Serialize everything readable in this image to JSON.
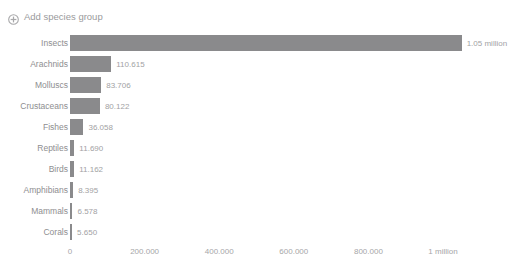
{
  "page": {
    "background_color": "#ffffff",
    "ghost_header_text": "· · ·   · ·   · ·   ·   · · ·   ·   ·"
  },
  "toolbar": {
    "add_group_label": "Add species group",
    "add_group_icon": "circle-plus-icon",
    "text_color": "#9a9a9c"
  },
  "chart_data": {
    "type": "bar",
    "orientation": "horizontal",
    "title": "",
    "subtitle": "",
    "xlabel": "",
    "ylabel": "",
    "grid": false,
    "legend": false,
    "bar_color": "#8a8a8c",
    "value_label_color": "#a2a2a4",
    "category_label_color": "#8e8e90",
    "xlim": [
      0,
      1100000
    ],
    "xticks": [
      0,
      200000,
      400000,
      600000,
      800000,
      1000000
    ],
    "xticklabels": [
      "0",
      "200.000",
      "400.000",
      "600.000",
      "800.000",
      "1 million"
    ],
    "categories": [
      "Insects",
      "Arachnids",
      "Molluscs",
      "Crustaceans",
      "Fishes",
      "Reptiles",
      "Birds",
      "Amphibians",
      "Mammals",
      "Corals"
    ],
    "values": [
      1050000,
      110615,
      83706,
      80122,
      36058,
      11690,
      11162,
      8395,
      6578,
      5650
    ],
    "value_labels": [
      "1.05 million",
      "110.615",
      "83.706",
      "80.122",
      "36.058",
      "11.690",
      "11.162",
      "8.395",
      "6.578",
      "5.650"
    ]
  }
}
